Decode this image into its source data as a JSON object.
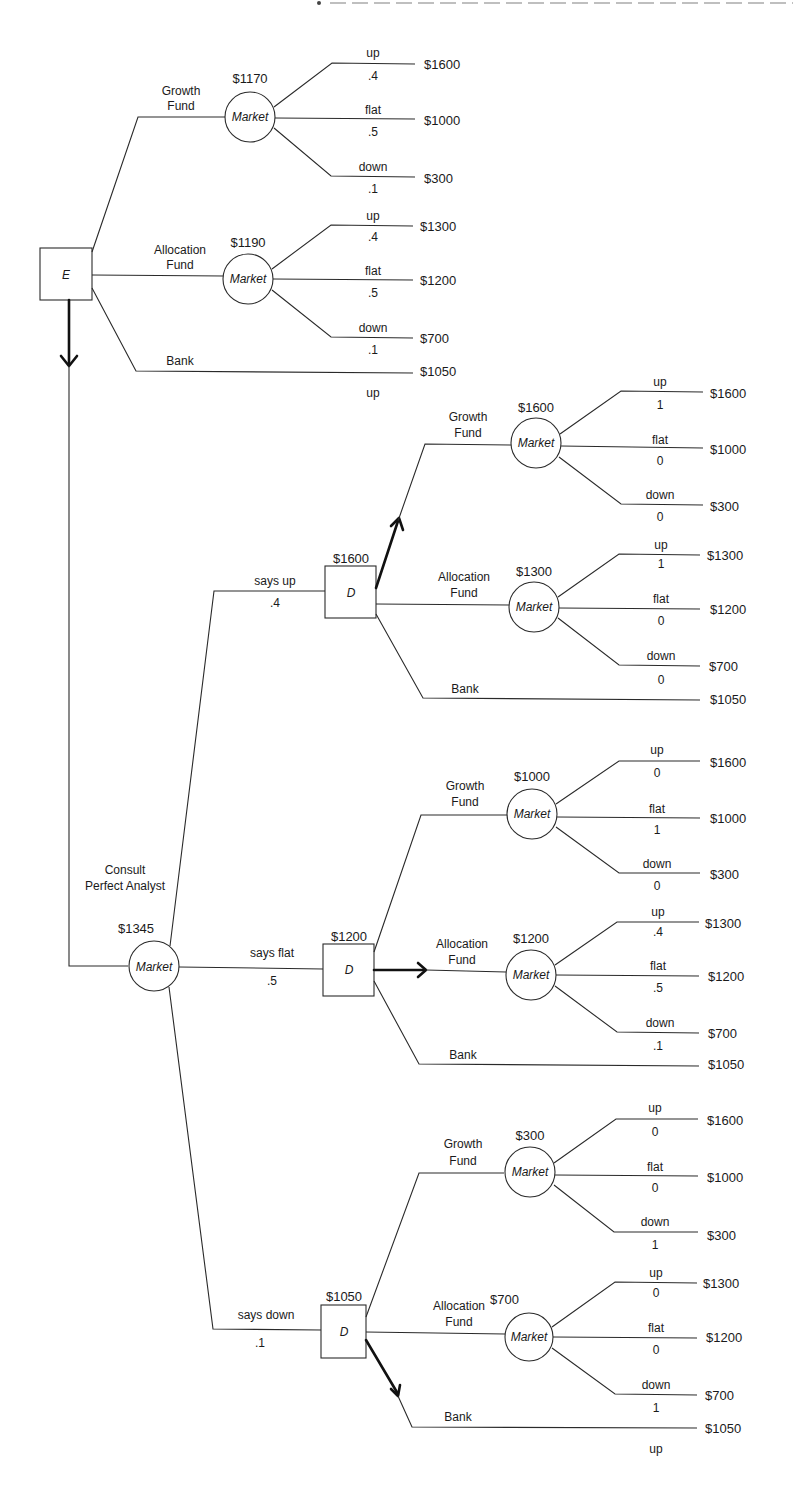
{
  "header_fragment": "",
  "colors": {
    "line": "#2a2a2a",
    "text": "#1a1a1a",
    "background": "#ffffff"
  },
  "root": {
    "node_type": "decision",
    "label": "E"
  },
  "labels": {
    "growth_fund_1": "Growth",
    "growth_fund_2": "Fund",
    "allocation_fund_1": "Allocation",
    "allocation_fund_2": "Fund",
    "bank": "Bank",
    "market": "Market",
    "decision": "D",
    "up": "up",
    "flat": "flat",
    "down": "down",
    "consult_1": "Consult",
    "consult_2": "Perfect Analyst",
    "says_up": "says up",
    "says_flat": "says flat",
    "says_down": "says down"
  },
  "top": {
    "growth": {
      "ev": "$1170",
      "outcomes": [
        {
          "label": "up",
          "prob": ".4",
          "payoff": "$1600"
        },
        {
          "label": "flat",
          "prob": ".5",
          "payoff": "$1000"
        },
        {
          "label": "down",
          "prob": ".1",
          "payoff": "$300"
        }
      ]
    },
    "allocation": {
      "ev": "$1190",
      "outcomes": [
        {
          "label": "up",
          "prob": ".4",
          "payoff": "$1300"
        },
        {
          "label": "flat",
          "prob": ".5",
          "payoff": "$1200"
        },
        {
          "label": "down",
          "prob": ".1",
          "payoff": "$700"
        }
      ]
    },
    "bank": {
      "payoff": "$1050"
    },
    "stray_label": "up"
  },
  "analyst": {
    "ev": "$1345",
    "branches": [
      {
        "signal": "says up",
        "prob": ".4",
        "decision_ev": "$1600",
        "growth": {
          "ev": "$1600",
          "outcomes": [
            {
              "label": "up",
              "prob": "1",
              "payoff": "$1600"
            },
            {
              "label": "flat",
              "prob": "0",
              "payoff": "$1000"
            },
            {
              "label": "down",
              "prob": "0",
              "payoff": "$300"
            }
          ]
        },
        "allocation": {
          "ev": "$1300",
          "outcomes": [
            {
              "label": "up",
              "prob": "1",
              "payoff": "$1300"
            },
            {
              "label": "flat",
              "prob": "0",
              "payoff": "$1200"
            },
            {
              "label": "down",
              "prob": "0",
              "payoff": "$700"
            }
          ]
        },
        "bank": {
          "payoff": "$1050"
        }
      },
      {
        "signal": "says flat",
        "prob": ".5",
        "decision_ev": "$1200",
        "growth": {
          "ev": "$1000",
          "outcomes": [
            {
              "label": "up",
              "prob": "0",
              "payoff": "$1600"
            },
            {
              "label": "flat",
              "prob": "1",
              "payoff": "$1000"
            },
            {
              "label": "down",
              "prob": "0",
              "payoff": "$300"
            }
          ]
        },
        "allocation": {
          "ev": "$1200",
          "outcomes": [
            {
              "label": "up",
              "prob": ".4",
              "payoff": "$1300"
            },
            {
              "label": "flat",
              "prob": ".5",
              "payoff": "$1200"
            },
            {
              "label": "down",
              "prob": ".1",
              "payoff": "$700"
            }
          ]
        },
        "bank": {
          "payoff": "$1050"
        }
      },
      {
        "signal": "says down",
        "prob": ".1",
        "decision_ev": "$1050",
        "growth": {
          "ev": "$300",
          "outcomes": [
            {
              "label": "up",
              "prob": "0",
              "payoff": "$1600"
            },
            {
              "label": "flat",
              "prob": "0",
              "payoff": "$1000"
            },
            {
              "label": "down",
              "prob": "1",
              "payoff": "$300"
            }
          ]
        },
        "allocation": {
          "ev": "$700",
          "outcomes": [
            {
              "label": "up",
              "prob": "0",
              "payoff": "$1300"
            },
            {
              "label": "flat",
              "prob": "0",
              "payoff": "$1200"
            },
            {
              "label": "down",
              "prob": "1",
              "payoff": "$700"
            }
          ]
        },
        "bank": {
          "payoff": "$1050"
        },
        "stray_label": "up"
      }
    ]
  }
}
